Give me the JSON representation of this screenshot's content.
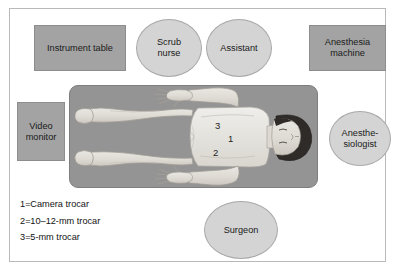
{
  "figure": {
    "type": "operating-room-setup-diagram",
    "title": "",
    "frame_color": "#b9b9b9",
    "background": "#ffffff"
  },
  "equipment": [
    {
      "id": "instrument-table",
      "label": "Instrument table",
      "shape": "rectangle",
      "color": "#a3a3a3",
      "x": 33,
      "y": 24,
      "w": 92,
      "h": 46,
      "font_size": 9.2
    },
    {
      "id": "anesthesia-machine",
      "label": "Anesthesia\nmachine",
      "line1": "Anesthesia",
      "line2": "machine",
      "shape": "rectangle",
      "color": "#a3a3a3",
      "x": 308,
      "y": 24,
      "w": 77,
      "h": 46,
      "font_size": 9.2
    },
    {
      "id": "video-monitor",
      "label": "Video\nmonitor",
      "line1": "Video",
      "line2": "monitor",
      "shape": "rectangle",
      "color": "#a3a3a3",
      "x": 16,
      "y": 101,
      "w": 48,
      "h": 59,
      "font_size": 9.2
    }
  ],
  "staff": [
    {
      "id": "scrub-nurse",
      "label": "Scrub\nnurse",
      "line1": "Scrub",
      "line2": "nurse",
      "shape": "ellipse",
      "color": "#d4d4d4",
      "x": 135,
      "y": 18,
      "w": 66,
      "h": 58,
      "font_size": 9.2
    },
    {
      "id": "assistant",
      "label": "Assistant",
      "line1": "Assistant",
      "line2": "",
      "shape": "ellipse",
      "color": "#d4d4d4",
      "x": 205,
      "y": 18,
      "w": 66,
      "h": 58,
      "font_size": 9.2
    },
    {
      "id": "anesthesiologist",
      "label": "Anesthe-\nsiologist",
      "line1": "Anesthe-",
      "line2": "siologist",
      "shape": "ellipse",
      "color": "#d4d4d4",
      "x": 328,
      "y": 110,
      "w": 62,
      "h": 55,
      "font_size": 9.2
    },
    {
      "id": "surgeon",
      "label": "Surgeon",
      "line1": "Surgeon",
      "line2": "",
      "shape": "ellipse",
      "color": "#d4d4d4",
      "x": 203,
      "y": 200,
      "w": 74,
      "h": 58,
      "font_size": 9.2
    }
  ],
  "operating_table": {
    "id": "operating-table",
    "color": "#949494",
    "x": 68,
    "y": 84,
    "w": 249,
    "h": 103,
    "patient_orientation": "supine, head to the right, arms abducted",
    "trocar_markers": [
      {
        "label": "3",
        "x": 213,
        "y": 118
      },
      {
        "label": "1",
        "x": 226,
        "y": 131
      },
      {
        "label": "2",
        "x": 211,
        "y": 145
      }
    ]
  },
  "legend": {
    "items": [
      {
        "key": "1",
        "eq": "=",
        "text": "Camera trocar"
      },
      {
        "key": "2",
        "eq": "=",
        "text": "10–12-mm trocar"
      },
      {
        "key": "3",
        "eq": "=",
        "text": "5-mm trocar"
      }
    ]
  }
}
